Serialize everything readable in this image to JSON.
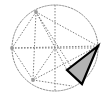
{
  "figure": {
    "canvas": {
      "width": 108,
      "height": 98,
      "background": "#ffffff"
    },
    "colors": {
      "construction_line": "#808080",
      "circle_outline": "#8a8a8a",
      "triangle_fill": "#b3b3b3",
      "triangle_stroke": "#000000",
      "vertex_marker": "#9a9a9a"
    },
    "circle": {
      "label": "circumscribed-circle",
      "cx": 55,
      "cy": 48,
      "r": 43,
      "stroke_dash": "1.5 1.5",
      "stroke_width": 1
    },
    "axes": [
      {
        "label": "horizontal-axis",
        "x1": 12,
        "y1": 48,
        "x2": 98,
        "y2": 48
      },
      {
        "label": "vertical-axis",
        "x1": 55,
        "y1": 5,
        "x2": 55,
        "y2": 91
      }
    ],
    "vertices": [
      {
        "label": "vertex-top",
        "x": 36,
        "y": 12
      },
      {
        "label": "vertex-right",
        "x": 98,
        "y": 46
      },
      {
        "label": "vertex-bottom-left",
        "x": 33,
        "y": 80
      },
      {
        "label": "vertex-left",
        "x": 12,
        "y": 48
      },
      {
        "label": "vertex-center",
        "x": 55,
        "y": 48
      }
    ],
    "construction_lines": [
      {
        "label": "chord-top-to-right",
        "x1": 36,
        "y1": 12,
        "x2": 98,
        "y2": 46
      },
      {
        "label": "chord-top-to-bottomleft",
        "x1": 36,
        "y1": 12,
        "x2": 33,
        "y2": 80
      },
      {
        "label": "chord-top-to-left",
        "x1": 36,
        "y1": 12,
        "x2": 12,
        "y2": 48
      },
      {
        "label": "chord-top-to-triangle-left",
        "x1": 36,
        "y1": 12,
        "x2": 67,
        "y2": 70
      },
      {
        "label": "chord-top-to-bottom-arc",
        "x1": 36,
        "y1": 12,
        "x2": 82,
        "y2": 84
      },
      {
        "label": "chord-right-to-bottomleft",
        "x1": 98,
        "y1": 46,
        "x2": 33,
        "y2": 80
      },
      {
        "label": "chord-left-to-bottomleft",
        "x1": 12,
        "y1": 48,
        "x2": 33,
        "y2": 80
      },
      {
        "label": "chord-left-to-right-upper",
        "x1": 12,
        "y1": 48,
        "x2": 98,
        "y2": 46
      },
      {
        "label": "chord-bottomleft-to-center",
        "x1": 33,
        "y1": 80,
        "x2": 55,
        "y2": 48
      },
      {
        "label": "chord-bottomleft-to-bottom",
        "x1": 33,
        "y1": 80,
        "x2": 72,
        "y2": 86
      }
    ],
    "shaded_triangle": {
      "label": "shaded-triangle",
      "points": "98,46 67,70 82,84",
      "fill": "#b3b3b3",
      "stroke": "#000000",
      "stroke_width": 2.2
    }
  }
}
